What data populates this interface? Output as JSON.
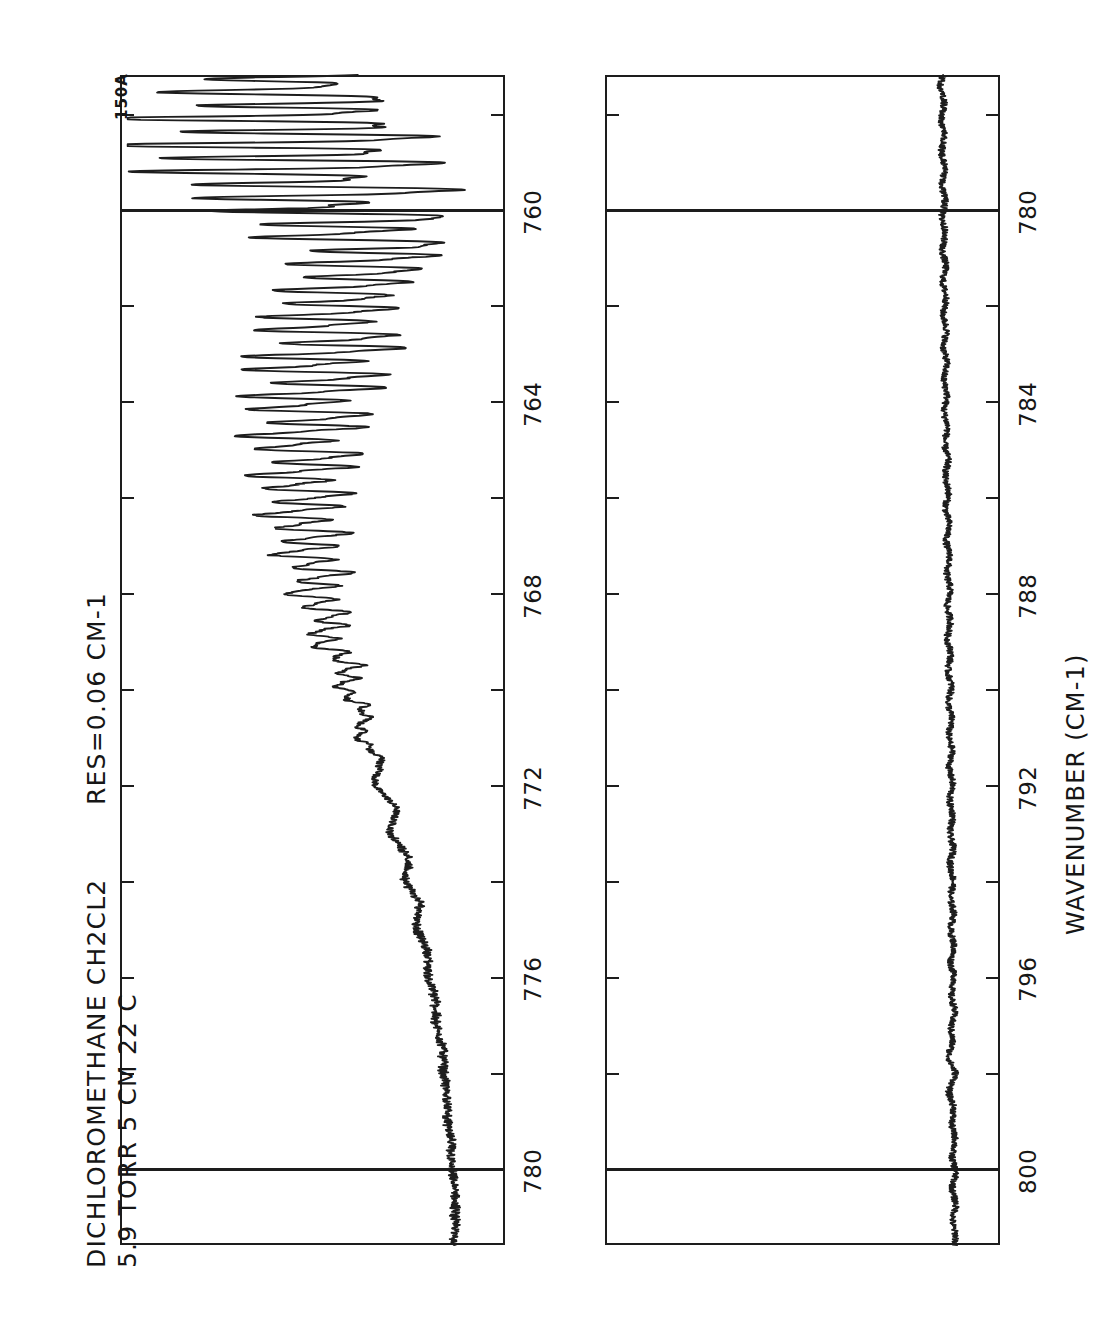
{
  "figure": {
    "plate_code": "150A",
    "sample_line1": "DICHLOROMETHANE  CH2CL2",
    "sample_line2": "5.9 TORR  5 CM  22 C",
    "resolution": "RES=0.06 CM-1",
    "axis_label": "WAVENUMBER (CM-1)"
  },
  "chart_data": {
    "type": "line",
    "title": "DICHLOROMETHANE  CH2CL2",
    "subtitle": "5.9 TORR  5 CM  22 C",
    "annotation": "RES=0.06 CM-1",
    "plate": "150A",
    "xlabel": "WAVENUMBER (CM-1)",
    "ylabel": "",
    "grid": true,
    "legend": "none",
    "orientation": "rotated-90",
    "panels": [
      {
        "name": "panel-upper",
        "xlim": [
          757.2,
          781.6
        ],
        "ticks_major": [
          760,
          764,
          768,
          772,
          776,
          780
        ],
        "ticks_minor": [
          758,
          762,
          766,
          770,
          774,
          778
        ],
        "tick_labels": [
          "760",
          "764",
          "768",
          "772",
          "776",
          "780"
        ],
        "gridlines": [
          760,
          780
        ],
        "ylim": [
          0,
          1
        ],
        "series": [
          {
            "name": "transmittance",
            "comment": "baseline near 0.87 at high wavenumber, deep nu4 band absorption centered ~758-766 with dense rotational fine structure",
            "x": [
              757.2,
              757.5,
              757.8,
              758.1,
              758.4,
              758.7,
              759.0,
              759.3,
              759.6,
              759.9,
              760.2,
              760.5,
              760.8,
              761.1,
              761.4,
              761.7,
              762.0,
              762.4,
              762.8,
              763.2,
              763.6,
              764.0,
              764.4,
              764.8,
              765.2,
              765.6,
              766.0,
              766.4,
              766.8,
              767.2,
              767.6,
              768.0,
              768.5,
              769.0,
              769.5,
              770.0,
              770.5,
              771.0,
              771.5,
              772.0,
              772.5,
              773.0,
              773.5,
              774.0,
              774.5,
              775.0,
              775.5,
              776.0,
              776.5,
              777.0,
              777.5,
              778.0,
              778.5,
              779.0,
              779.5,
              780.0,
              780.5,
              781.0,
              781.6
            ],
            "y": [
              0.52,
              0.35,
              0.58,
              0.3,
              0.62,
              0.33,
              0.6,
              0.36,
              0.66,
              0.4,
              0.7,
              0.52,
              0.74,
              0.62,
              0.66,
              0.56,
              0.6,
              0.5,
              0.62,
              0.46,
              0.58,
              0.44,
              0.55,
              0.42,
              0.54,
              0.43,
              0.52,
              0.44,
              0.52,
              0.46,
              0.54,
              0.48,
              0.56,
              0.52,
              0.6,
              0.58,
              0.64,
              0.62,
              0.68,
              0.66,
              0.72,
              0.7,
              0.75,
              0.74,
              0.78,
              0.77,
              0.8,
              0.8,
              0.82,
              0.82,
              0.84,
              0.84,
              0.85,
              0.85,
              0.86,
              0.86,
              0.87,
              0.87,
              0.87
            ]
          }
        ]
      },
      {
        "name": "panel-lower",
        "xlim": [
          777.2,
          801.6
        ],
        "ticks_major": [
          780,
          784,
          788,
          792,
          796,
          800
        ],
        "ticks_minor": [
          778,
          782,
          786,
          790,
          794,
          798
        ],
        "tick_labels": [
          "780",
          "784",
          "788",
          "792",
          "796",
          "800"
        ],
        "gridlines": [
          780,
          800
        ],
        "ylim": [
          0,
          1
        ],
        "series": [
          {
            "name": "transmittance",
            "comment": "essentially flat noisy baseline, slight rise from 0.855 to 0.885 with a small dip feature near 798",
            "x": [
              777.2,
              778,
              779,
              780,
              781,
              782,
              783,
              784,
              785,
              786,
              787,
              788,
              789,
              790,
              791,
              792,
              793,
              794,
              795,
              796,
              797,
              797.6,
              798.0,
              798.4,
              799,
              800,
              801,
              801.6
            ],
            "y": [
              0.852,
              0.855,
              0.856,
              0.857,
              0.858,
              0.86,
              0.861,
              0.862,
              0.864,
              0.866,
              0.868,
              0.87,
              0.871,
              0.873,
              0.874,
              0.876,
              0.877,
              0.878,
              0.879,
              0.88,
              0.881,
              0.872,
              0.884,
              0.874,
              0.882,
              0.883,
              0.884,
              0.884
            ]
          }
        ]
      }
    ]
  }
}
